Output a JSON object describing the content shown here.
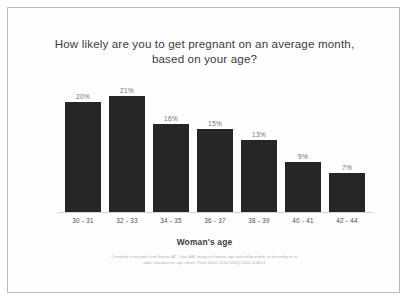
{
  "frame": {
    "border_color": "#b9b9b9",
    "background_color": "#ffffff"
  },
  "title": {
    "line1": "How likely are you to get pregnant on an average month,",
    "line2": "based on your age?"
  },
  "axis": {
    "x_title": "Woman's age"
  },
  "citation": {
    "line1": "Compiled using data from Steiner AZ, Jukic AM. Impact of female age and nulligravidity on fecundity in an",
    "line2": "older reproductive age cohort. Fertil Steril. 2016;106(5):1142-1148.e1"
  },
  "chart_data": {
    "type": "bar",
    "title": "How likely are you to get pregnant on an average month, based on your age?",
    "xlabel": "Woman's age",
    "ylabel": "",
    "ylim": [
      0,
      21
    ],
    "grid": false,
    "legend": null,
    "bar_color": "#262628",
    "value_label_color": "#6e6e70",
    "categories": [
      "30 - 31",
      "32 - 33",
      "34 - 35",
      "36 - 37",
      "38 - 39",
      "40 - 41",
      "42 - 44"
    ],
    "values": [
      20,
      21,
      16,
      15,
      13,
      9,
      7
    ],
    "value_labels": [
      "20%",
      "21%",
      "16%",
      "15%",
      "13%",
      "9%",
      "7%"
    ]
  }
}
